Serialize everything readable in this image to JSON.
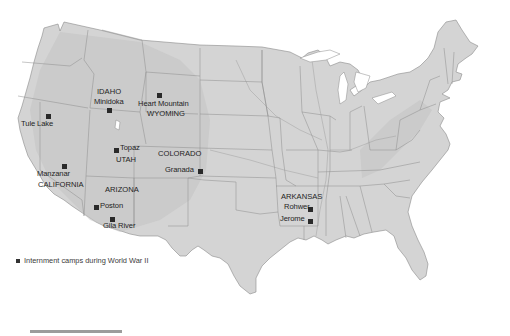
{
  "map": {
    "type": "shaded relief map of the contiguous United States",
    "colors": {
      "land": "#d4d4d4",
      "border": "#8c8c8c",
      "marker": "#2a2a2a",
      "background": "#ffffff",
      "scalebar": "#9c9c9c"
    }
  },
  "states": [
    {
      "name": "IDAHO",
      "x": 102,
      "y": 88
    },
    {
      "name": "WYOMING",
      "x": 174,
      "y": 113
    },
    {
      "name": "UTAH",
      "x": 117,
      "y": 155
    },
    {
      "name": "COLORADO",
      "x": 185,
      "y": 148
    },
    {
      "name": "CALIFORNIA",
      "x": 37,
      "y": 182
    },
    {
      "name": "ARIZONA",
      "x": 104,
      "y": 188
    },
    {
      "name": "ARKANSAS",
      "x": 282,
      "y": 193
    }
  ],
  "camps": [
    {
      "name": "Tule Lake",
      "label_x": 21,
      "label_y": 117,
      "marker_x": 47,
      "marker_y": 114
    },
    {
      "name": "Minidoka",
      "label_x": 95,
      "label_y": 100,
      "marker_x": 108,
      "marker_y": 108
    },
    {
      "name": "Heart Mountain",
      "label_x": 141,
      "label_y": 100,
      "marker_x": 157,
      "marker_y": 93
    },
    {
      "name": "Topaz",
      "label_x": 120,
      "label_y": 143,
      "marker_x": 114,
      "marker_y": 149
    },
    {
      "name": "Granada",
      "label_x": 164,
      "label_y": 167,
      "marker_x": 198,
      "marker_y": 169
    },
    {
      "name": "Manzanar",
      "label_x": 36,
      "label_y": 170,
      "marker_x": 62,
      "marker_y": 165
    },
    {
      "name": "Poston",
      "label_x": 100,
      "label_y": 203,
      "marker_x": 94,
      "marker_y": 205
    },
    {
      "name": "Gila River",
      "label_x": 102,
      "label_y": 223,
      "marker_x": 110,
      "marker_y": 217
    },
    {
      "name": "Rohwer",
      "label_x": 284,
      "label_y": 203,
      "marker_x": 308,
      "marker_y": 207
    },
    {
      "name": "Jerome",
      "label_x": 280,
      "label_y": 215,
      "marker_x": 308,
      "marker_y": 219
    }
  ],
  "legend": {
    "symbol": "filled-square",
    "text": "Internment camps during World War II"
  }
}
